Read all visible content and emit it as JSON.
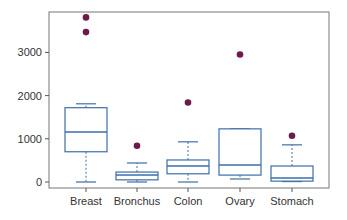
{
  "chart_data": {
    "type": "box",
    "title": "",
    "xlabel": "",
    "ylabel": "",
    "categories": [
      "Breast",
      "Bronchus",
      "Colon",
      "Ovary",
      "Stomach"
    ],
    "yticks": [
      0,
      1000,
      2000,
      3000
    ],
    "ylim": [
      -130,
      3950
    ],
    "grid": false,
    "legend": null,
    "boxes": [
      {
        "name": "Breast",
        "whisker_low": 0,
        "q1": 700,
        "median": 1160,
        "q3": 1720,
        "whisker_high": 1810,
        "outliers": [
          3810,
          3470
        ]
      },
      {
        "name": "Bronchus",
        "whisker_low": 0,
        "q1": 50,
        "median": 160,
        "q3": 230,
        "whisker_high": 440,
        "outliers": [
          840
        ]
      },
      {
        "name": "Colon",
        "whisker_low": 0,
        "q1": 190,
        "median": 370,
        "q3": 510,
        "whisker_high": 930,
        "outliers": [
          1840
        ]
      },
      {
        "name": "Ovary",
        "whisker_low": 70,
        "q1": 160,
        "median": 395,
        "q3": 1230,
        "whisker_high": 1230,
        "outliers": [
          2950
        ]
      },
      {
        "name": "Stomach",
        "whisker_low": 10,
        "q1": 20,
        "median": 90,
        "q3": 370,
        "whisker_high": 860,
        "outliers": [
          1070
        ]
      }
    ],
    "colors": {
      "box": "#3d6ea6",
      "outlier": "#6b1a4a",
      "axis": "#555555",
      "whisker": "#3d6ea6"
    }
  }
}
